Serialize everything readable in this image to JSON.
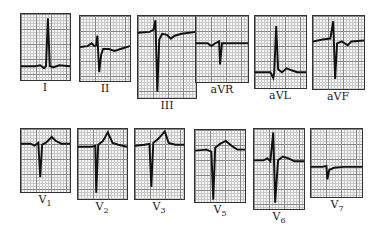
{
  "leads": [
    {
      "id": "I",
      "label": "I",
      "sub": ""
    },
    {
      "id": "II",
      "label": "II",
      "sub": ""
    },
    {
      "id": "III",
      "label": "III",
      "sub": ""
    },
    {
      "id": "aVR",
      "label": "aVR",
      "sub": ""
    },
    {
      "id": "aVL",
      "label": "aVL",
      "sub": ""
    },
    {
      "id": "aVF",
      "label": "aVF",
      "sub": ""
    },
    {
      "id": "V1",
      "label": "V",
      "sub": "1"
    },
    {
      "id": "V2",
      "label": "V",
      "sub": "2"
    },
    {
      "id": "V3",
      "label": "V",
      "sub": "3"
    },
    {
      "id": "V5",
      "label": "V",
      "sub": "5"
    },
    {
      "id": "V6",
      "label": "V",
      "sub": "6"
    },
    {
      "id": "V7",
      "label": "V",
      "sub": "7"
    }
  ],
  "colors": {
    "trace": "#111111",
    "grid_major": "#888888",
    "grid_minor": "#c8c8c8",
    "paper": "#f4f4f4"
  }
}
